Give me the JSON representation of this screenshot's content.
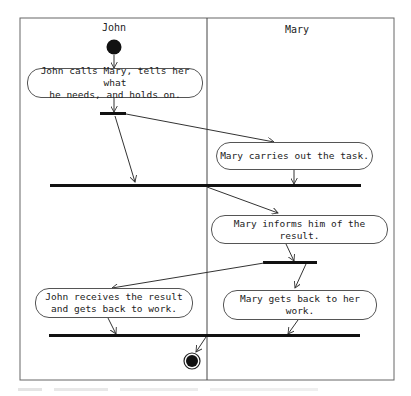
{
  "diagram": {
    "type": "UML activity diagram with swimlanes",
    "colors": {
      "stroke": "#333333",
      "bar": "#111111",
      "background": "#ffffff"
    },
    "lanes": [
      {
        "id": "john",
        "label": "John"
      },
      {
        "id": "mary",
        "label": "Mary"
      }
    ],
    "activities": [
      {
        "id": "a1",
        "lane": "john",
        "text": "John calls Mary, tells her what\nhe needs, and holds on."
      },
      {
        "id": "a2",
        "lane": "mary",
        "text": "Mary carries out the task."
      },
      {
        "id": "a3",
        "lane": "mary",
        "text": "Mary informs him of the result."
      },
      {
        "id": "a4",
        "lane": "john",
        "text": "John receives the result\nand gets back to work."
      },
      {
        "id": "a5",
        "lane": "mary",
        "text": "Mary gets back to her work."
      }
    ],
    "nodes": [
      {
        "id": "start",
        "kind": "initial"
      },
      {
        "id": "fork1",
        "kind": "fork"
      },
      {
        "id": "join1",
        "kind": "join"
      },
      {
        "id": "fork2",
        "kind": "fork"
      },
      {
        "id": "join2",
        "kind": "join"
      },
      {
        "id": "end",
        "kind": "final"
      }
    ],
    "edges": [
      [
        "start",
        "a1"
      ],
      [
        "a1",
        "fork1"
      ],
      [
        "fork1",
        "join1"
      ],
      [
        "fork1",
        "a2"
      ],
      [
        "a2",
        "join1"
      ],
      [
        "join1",
        "a3"
      ],
      [
        "a3",
        "fork2"
      ],
      [
        "fork2",
        "a4"
      ],
      [
        "fork2",
        "a5"
      ],
      [
        "a4",
        "join2"
      ],
      [
        "a5",
        "join2"
      ],
      [
        "join2",
        "end"
      ]
    ]
  }
}
